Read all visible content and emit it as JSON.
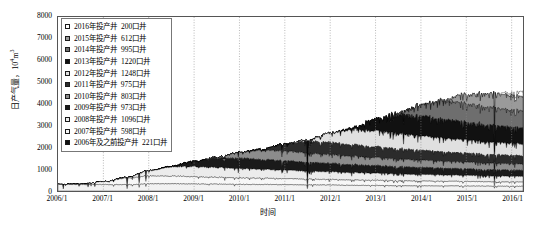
{
  "chart_data": {
    "type": "area",
    "title": "",
    "xlabel": "时间",
    "ylabel": "日产气量，10⁴m³",
    "ylabel_main": "日产气量，10",
    "ylabel_sup": "4",
    "ylabel_unit_tail": "m",
    "ylabel_sup2": "3",
    "ylim": [
      0,
      8000
    ],
    "ytick_labels": [
      "8000",
      "7000",
      "6000",
      "5000",
      "4000",
      "3000",
      "2000",
      "1000",
      "0"
    ],
    "ytick_values": [
      8000,
      7000,
      6000,
      5000,
      4000,
      3000,
      2000,
      1000,
      0
    ],
    "xtick_labels": [
      "2006/1",
      "2007/1",
      "2008/1",
      "2009/1",
      "2010/1",
      "2011/1",
      "2012/1",
      "2013/1",
      "2014/1",
      "2015/1",
      "2016/1"
    ],
    "x": [
      2006.0,
      2006.5,
      2007.0,
      2007.5,
      2008.0,
      2008.5,
      2009.0,
      2009.5,
      2010.0,
      2010.5,
      2011.0,
      2011.5,
      2012.0,
      2012.5,
      2013.0,
      2013.5,
      2014.0,
      2014.5,
      2015.0,
      2015.5,
      2016.0,
      2016.25
    ],
    "xlim": [
      2006.0,
      2016.25
    ],
    "grid": "vertical-dotted",
    "legend_position": "upper-left-inside",
    "stacked": true,
    "stack_order_bottom_to_top": [
      "2006年及之前投产井",
      "2007年投产井",
      "2008年投产井",
      "2009年投产井",
      "2010年投产井",
      "2011年投产井",
      "2012年投产井",
      "2013年投产井",
      "2014年投产井",
      "2015年投产井",
      "2016年投产井"
    ],
    "series": [
      {
        "name": "2006年及之前投产井",
        "wells": "221口井",
        "color": "#f2f2f2",
        "values": [
          300,
          300,
          295,
          290,
          330,
          330,
          320,
          310,
          300,
          295,
          290,
          280,
          270,
          260,
          250,
          240,
          235,
          230,
          225,
          220,
          215,
          212
        ]
      },
      {
        "name": "2007年投产井",
        "wells": "598口井",
        "color": "#f7f7f7",
        "values": [
          0,
          20,
          130,
          300,
          360,
          350,
          330,
          315,
          300,
          285,
          275,
          265,
          255,
          245,
          238,
          230,
          222,
          215,
          208,
          202,
          198,
          196
        ]
      },
      {
        "name": "2008年投产井",
        "wells": "1096口井",
        "color": "#ececec",
        "values": [
          0,
          0,
          0,
          30,
          240,
          420,
          470,
          450,
          430,
          410,
          390,
          372,
          355,
          340,
          325,
          312,
          300,
          290,
          280,
          272,
          265,
          262
        ]
      },
      {
        "name": "2009年投产井",
        "wells": "973口井",
        "color": "#1a1a1a",
        "values": [
          0,
          0,
          0,
          0,
          0,
          30,
          250,
          430,
          480,
          455,
          430,
          408,
          388,
          370,
          353,
          338,
          324,
          312,
          300,
          290,
          282,
          278
        ]
      },
      {
        "name": "2010年投产井",
        "wells": "803口井",
        "color": "#8c8c8c",
        "values": [
          0,
          0,
          0,
          0,
          0,
          0,
          0,
          40,
          260,
          420,
          450,
          425,
          402,
          382,
          364,
          348,
          334,
          321,
          309,
          299,
          290,
          286
        ]
      },
      {
        "name": "2011年投产井",
        "wells": "975口井",
        "color": "#2b2b2b",
        "values": [
          0,
          0,
          0,
          0,
          0,
          0,
          0,
          0,
          0,
          60,
          330,
          520,
          560,
          530,
          503,
          478,
          456,
          436,
          418,
          402,
          388,
          382
        ]
      },
      {
        "name": "2012年投产井",
        "wells": "1248口井",
        "color": "#e0e0e0",
        "values": [
          0,
          0,
          0,
          0,
          0,
          0,
          0,
          0,
          0,
          0,
          0,
          80,
          430,
          690,
          740,
          700,
          663,
          630,
          600,
          573,
          550,
          540
        ]
      },
      {
        "name": "2013年投产井",
        "wells": "1220口井",
        "color": "#111111",
        "values": [
          0,
          0,
          0,
          0,
          0,
          0,
          0,
          0,
          0,
          0,
          0,
          0,
          0,
          90,
          560,
          880,
          930,
          880,
          836,
          796,
          762,
          748
        ]
      },
      {
        "name": "2014年投产井",
        "wells": "995口井",
        "color": "#6e6e6e",
        "values": [
          0,
          0,
          0,
          0,
          0,
          0,
          0,
          0,
          0,
          0,
          0,
          0,
          0,
          0,
          0,
          80,
          520,
          820,
          870,
          826,
          786,
          770
        ]
      },
      {
        "name": "2015年投产井",
        "wells": "612口井",
        "color": "#9a9a9a",
        "values": [
          0,
          0,
          0,
          0,
          0,
          0,
          0,
          0,
          0,
          0,
          0,
          0,
          0,
          0,
          0,
          0,
          0,
          70,
          430,
          640,
          680,
          666
        ]
      },
      {
        "name": "2016年投产井",
        "wells": "200口井",
        "color": "#ffffff",
        "values": [
          0,
          0,
          0,
          0,
          0,
          0,
          0,
          0,
          0,
          0,
          0,
          0,
          0,
          0,
          0,
          0,
          0,
          0,
          0,
          0,
          120,
          240
        ]
      }
    ],
    "legend_entries": [
      {
        "label": "2016年投产井",
        "count": "200口井",
        "swatch": "#ffffff"
      },
      {
        "label": "2015年投产井",
        "count": "612口井",
        "swatch": "#9a9a9a"
      },
      {
        "label": "2014年投产井",
        "count": "995口井",
        "swatch": "#6e6e6e"
      },
      {
        "label": "2013年投产井",
        "count": "1220口井",
        "swatch": "#111111"
      },
      {
        "label": "2012年投产井",
        "count": "1248口井",
        "swatch": "#e0e0e0"
      },
      {
        "label": "2011年投产井",
        "count": "975口井",
        "swatch": "#2b2b2b"
      },
      {
        "label": "2010年投产井",
        "count": "803口井",
        "swatch": "#8c8c8c"
      },
      {
        "label": "2009年投产井",
        "count": "973口井",
        "swatch": "#1a1a1a"
      },
      {
        "label": "2008年投产井",
        "count": "1096口井",
        "swatch": "#ececec"
      },
      {
        "label": "2007年投产井",
        "count": "598口井",
        "swatch": "#f7f7f7"
      },
      {
        "label": "2006年及之前投产井",
        "count": "221口井",
        "swatch": "#111111"
      }
    ]
  }
}
